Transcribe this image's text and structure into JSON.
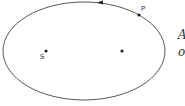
{
  "diagram": {
    "type": "elliptical orbit",
    "points": {
      "focus_label": "S",
      "planet_label": "P"
    },
    "side_text": [
      "A",
      "o"
    ],
    "direction": "counterclockwise"
  }
}
